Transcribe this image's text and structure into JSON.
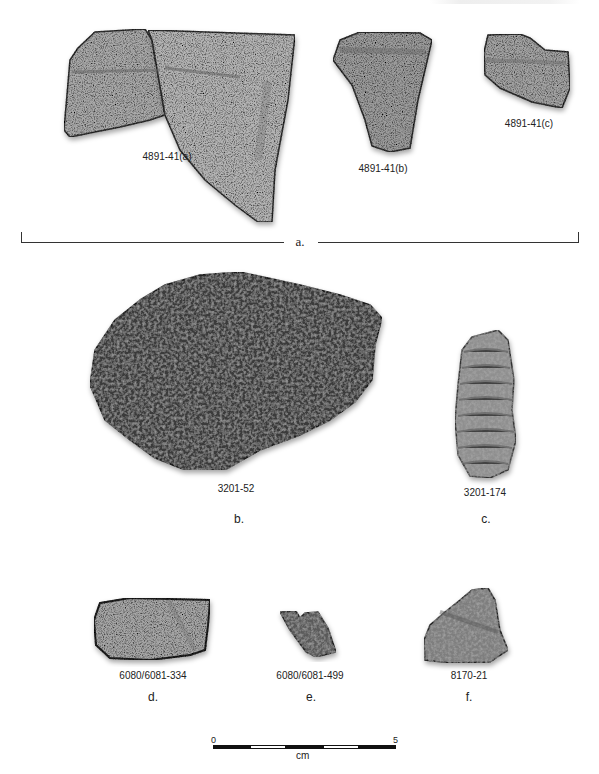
{
  "figure": {
    "header_fragment": "",
    "groups": [
      {
        "letter": "a.",
        "specimens": [
          {
            "id": "4891-41(a)",
            "tone": "light-gray"
          },
          {
            "id": "4891-41(b)",
            "tone": "gray"
          },
          {
            "id": "4891-41(c)",
            "tone": "gray"
          }
        ]
      },
      {
        "letter": "b.",
        "specimens": [
          {
            "id": "3201-52",
            "tone": "dark"
          }
        ]
      },
      {
        "letter": "c.",
        "specimens": [
          {
            "id": "3201-174",
            "tone": "gray-corrugated"
          }
        ]
      },
      {
        "letter": "d.",
        "specimens": [
          {
            "id": "6080/6081-334",
            "tone": "gray"
          }
        ]
      },
      {
        "letter": "e.",
        "specimens": [
          {
            "id": "6080/6081-499",
            "tone": "dark-gray"
          }
        ]
      },
      {
        "letter": "f.",
        "specimens": [
          {
            "id": "8170-21",
            "tone": "gray"
          }
        ]
      }
    ],
    "scale_bar": {
      "min_label": "0",
      "max_label": "5",
      "unit": "cm",
      "segments": 5
    }
  }
}
